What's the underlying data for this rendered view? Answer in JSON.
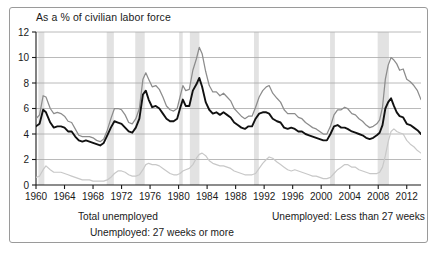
{
  "chart_title": "As a % of civilian labor force",
  "axes": {
    "y_ticks": [
      "0",
      "2",
      "4",
      "6",
      "8",
      "10",
      "12"
    ],
    "x_ticks": [
      "1960",
      "1964",
      "1968",
      "1972",
      "1976",
      "1980",
      "1984",
      "1988",
      "1992",
      "1996",
      "2000",
      "2004",
      "2008",
      "2012"
    ]
  },
  "legend": {
    "total": "Total unemployed",
    "less27": "Unemployed: Less than 27 weeks",
    "more27": "Unemployed: 27 weeks or more"
  },
  "colors": {
    "total": "#8c8c8c",
    "less27": "#111111",
    "more27": "#c8c8c8",
    "recession_band": "#e2e2e2",
    "gridline": "#a8a8a8",
    "axis": "#1a1a1a",
    "frame": "#9a9a9a"
  },
  "chart_data": {
    "type": "line",
    "title": "As a % of civilian labor force",
    "xlabel": "",
    "ylabel": "",
    "xlim": [
      1960,
      2014
    ],
    "ylim": [
      0,
      12
    ],
    "grid": true,
    "legend_position": "bottom",
    "recessions": [
      [
        1960.33,
        1961.17
      ],
      [
        1969.92,
        1970.92
      ],
      [
        1973.92,
        1975.25
      ],
      [
        1980.08,
        1980.58
      ],
      [
        1981.58,
        1982.92
      ],
      [
        1990.58,
        1991.25
      ],
      [
        2001.25,
        2001.92
      ],
      [
        2007.92,
        2009.5
      ]
    ],
    "series": [
      {
        "name": "Total unemployed",
        "color": "#8c8c8c",
        "x": [
          1960.0,
          1960.5,
          1961.0,
          1961.4,
          1962.0,
          1962.5,
          1963.0,
          1963.5,
          1964.0,
          1964.5,
          1965.0,
          1965.5,
          1966.0,
          1966.5,
          1967.0,
          1967.5,
          1968.0,
          1968.5,
          1969.0,
          1969.5,
          1970.0,
          1970.5,
          1971.0,
          1971.5,
          1972.0,
          1972.5,
          1973.0,
          1973.5,
          1974.0,
          1974.5,
          1975.0,
          1975.4,
          1975.8,
          1976.3,
          1976.8,
          1977.3,
          1977.8,
          1978.3,
          1978.8,
          1979.3,
          1979.8,
          1980.2,
          1980.6,
          1981.0,
          1981.5,
          1982.0,
          1982.5,
          1982.9,
          1983.3,
          1983.8,
          1984.3,
          1984.8,
          1985.3,
          1985.8,
          1986.3,
          1986.8,
          1987.3,
          1987.8,
          1988.3,
          1988.8,
          1989.3,
          1989.8,
          1990.3,
          1990.8,
          1991.3,
          1991.8,
          1992.3,
          1992.7,
          1993.2,
          1993.8,
          1994.3,
          1994.8,
          1995.3,
          1995.8,
          1996.3,
          1996.8,
          1997.3,
          1997.8,
          1998.3,
          1998.8,
          1999.3,
          1999.8,
          2000.3,
          2000.8,
          2001.3,
          2001.8,
          2002.3,
          2002.8,
          2003.3,
          2003.7,
          2004.3,
          2004.8,
          2005.3,
          2005.8,
          2006.3,
          2006.8,
          2007.3,
          2007.8,
          2008.2,
          2008.6,
          2009.0,
          2009.4,
          2009.8,
          2010.2,
          2010.6,
          2011.0,
          2011.5,
          2012.0,
          2012.5,
          2013.0,
          2013.5,
          2014.0
        ],
        "y": [
          5.2,
          5.5,
          7.0,
          6.9,
          6.0,
          5.6,
          5.7,
          5.6,
          5.4,
          5.0,
          4.9,
          4.4,
          3.9,
          3.8,
          3.8,
          3.8,
          3.7,
          3.5,
          3.4,
          3.6,
          4.3,
          5.2,
          6.0,
          6.0,
          5.9,
          5.5,
          4.9,
          4.8,
          5.2,
          6.0,
          8.3,
          8.8,
          8.3,
          7.7,
          7.8,
          7.5,
          6.9,
          6.2,
          5.9,
          5.8,
          6.0,
          6.9,
          7.8,
          7.4,
          7.5,
          9.0,
          9.9,
          10.8,
          10.3,
          8.9,
          7.8,
          7.3,
          7.3,
          7.0,
          7.2,
          6.9,
          6.6,
          6.0,
          5.7,
          5.4,
          5.2,
          5.4,
          5.4,
          6.1,
          6.9,
          7.4,
          7.7,
          7.8,
          7.2,
          6.8,
          6.5,
          5.9,
          5.6,
          5.6,
          5.6,
          5.3,
          5.2,
          4.9,
          4.7,
          4.5,
          4.4,
          4.2,
          4.0,
          4.0,
          4.6,
          5.5,
          5.9,
          5.9,
          6.1,
          6.0,
          5.6,
          5.5,
          5.2,
          5.0,
          4.7,
          4.5,
          4.6,
          4.8,
          5.1,
          6.1,
          8.3,
          9.4,
          10.0,
          9.8,
          9.5,
          9.0,
          9.1,
          8.3,
          8.1,
          7.8,
          7.4,
          6.7
        ]
      },
      {
        "name": "Unemployed: Less than 27 weeks",
        "color": "#111111",
        "x": [
          1960.0,
          1960.5,
          1961.0,
          1961.4,
          1962.0,
          1962.5,
          1963.0,
          1963.5,
          1964.0,
          1964.5,
          1965.0,
          1965.5,
          1966.0,
          1966.5,
          1967.0,
          1967.5,
          1968.0,
          1968.5,
          1969.0,
          1969.5,
          1970.0,
          1970.5,
          1971.0,
          1971.5,
          1972.0,
          1972.5,
          1973.0,
          1973.5,
          1974.0,
          1974.5,
          1975.0,
          1975.4,
          1975.8,
          1976.3,
          1976.8,
          1977.3,
          1977.8,
          1978.3,
          1978.8,
          1979.3,
          1979.8,
          1980.2,
          1980.6,
          1981.0,
          1981.5,
          1982.0,
          1982.5,
          1982.9,
          1983.3,
          1983.8,
          1984.3,
          1984.8,
          1985.3,
          1985.8,
          1986.3,
          1986.8,
          1987.3,
          1987.8,
          1988.3,
          1988.8,
          1989.3,
          1989.8,
          1990.3,
          1990.8,
          1991.3,
          1991.8,
          1992.3,
          1992.7,
          1993.2,
          1993.8,
          1994.3,
          1994.8,
          1995.3,
          1995.8,
          1996.3,
          1996.8,
          1997.3,
          1997.8,
          1998.3,
          1998.8,
          1999.3,
          1999.8,
          2000.3,
          2000.8,
          2001.3,
          2001.8,
          2002.3,
          2002.8,
          2003.3,
          2003.7,
          2004.3,
          2004.8,
          2005.3,
          2005.8,
          2006.3,
          2006.8,
          2007.3,
          2007.8,
          2008.2,
          2008.6,
          2009.0,
          2009.4,
          2009.8,
          2010.2,
          2010.6,
          2011.0,
          2011.5,
          2012.0,
          2012.5,
          2013.0,
          2013.5,
          2014.0
        ],
        "y": [
          4.6,
          4.8,
          5.9,
          5.7,
          4.9,
          4.5,
          4.6,
          4.6,
          4.5,
          4.2,
          4.2,
          3.8,
          3.5,
          3.4,
          3.5,
          3.4,
          3.3,
          3.2,
          3.1,
          3.3,
          3.9,
          4.5,
          5.0,
          4.9,
          4.8,
          4.5,
          4.2,
          4.1,
          4.5,
          5.2,
          7.1,
          7.4,
          6.7,
          6.1,
          6.2,
          6.0,
          5.6,
          5.2,
          5.0,
          5.0,
          5.2,
          6.0,
          6.7,
          6.2,
          6.2,
          7.4,
          7.9,
          8.4,
          7.7,
          6.5,
          5.9,
          5.6,
          5.7,
          5.5,
          5.7,
          5.5,
          5.3,
          4.9,
          4.7,
          4.5,
          4.4,
          4.6,
          4.6,
          5.2,
          5.6,
          5.7,
          5.7,
          5.6,
          5.2,
          5.0,
          4.9,
          4.5,
          4.4,
          4.5,
          4.4,
          4.2,
          4.2,
          4.0,
          3.9,
          3.8,
          3.7,
          3.6,
          3.5,
          3.5,
          4.0,
          4.6,
          4.7,
          4.5,
          4.5,
          4.4,
          4.2,
          4.1,
          4.0,
          3.9,
          3.7,
          3.6,
          3.7,
          3.9,
          4.1,
          4.7,
          6.0,
          6.5,
          6.8,
          6.2,
          5.7,
          5.4,
          5.3,
          4.8,
          4.7,
          4.5,
          4.3,
          4.0
        ]
      },
      {
        "name": "Unemployed: 27 weeks or more",
        "color": "#c8c8c8",
        "x": [
          1960.0,
          1960.5,
          1961.0,
          1961.4,
          1962.0,
          1962.5,
          1963.0,
          1963.5,
          1964.0,
          1964.5,
          1965.0,
          1965.5,
          1966.0,
          1966.5,
          1967.0,
          1967.5,
          1968.0,
          1968.5,
          1969.0,
          1969.5,
          1970.0,
          1970.5,
          1971.0,
          1971.5,
          1972.0,
          1972.5,
          1973.0,
          1973.5,
          1974.0,
          1974.5,
          1975.0,
          1975.4,
          1975.8,
          1976.3,
          1976.8,
          1977.3,
          1977.8,
          1978.3,
          1978.8,
          1979.3,
          1979.8,
          1980.2,
          1980.6,
          1981.0,
          1981.5,
          1982.0,
          1982.5,
          1982.9,
          1983.3,
          1983.8,
          1984.3,
          1984.8,
          1985.3,
          1985.8,
          1986.3,
          1986.8,
          1987.3,
          1987.8,
          1988.3,
          1988.8,
          1989.3,
          1989.8,
          1990.3,
          1990.8,
          1991.3,
          1991.8,
          1992.3,
          1992.7,
          1993.2,
          1993.8,
          1994.3,
          1994.8,
          1995.3,
          1995.8,
          1996.3,
          1996.8,
          1997.3,
          1997.8,
          1998.3,
          1998.8,
          1999.3,
          1999.8,
          2000.3,
          2000.8,
          2001.3,
          2001.8,
          2002.3,
          2002.8,
          2003.3,
          2003.7,
          2004.3,
          2004.8,
          2005.3,
          2005.8,
          2006.3,
          2006.8,
          2007.3,
          2007.8,
          2008.2,
          2008.6,
          2009.0,
          2009.4,
          2009.8,
          2010.2,
          2010.6,
          2011.0,
          2011.5,
          2012.0,
          2012.5,
          2013.0,
          2013.5,
          2014.0
        ],
        "y": [
          0.6,
          0.7,
          1.2,
          1.5,
          1.2,
          1.0,
          1.0,
          1.0,
          0.9,
          0.8,
          0.7,
          0.6,
          0.5,
          0.4,
          0.4,
          0.4,
          0.3,
          0.3,
          0.3,
          0.3,
          0.4,
          0.6,
          0.9,
          1.1,
          1.1,
          1.0,
          0.8,
          0.7,
          0.7,
          0.8,
          1.2,
          1.6,
          1.7,
          1.6,
          1.6,
          1.5,
          1.3,
          1.1,
          0.9,
          0.8,
          0.8,
          0.9,
          1.1,
          1.2,
          1.3,
          1.6,
          2.1,
          2.4,
          2.5,
          2.3,
          1.9,
          1.7,
          1.6,
          1.5,
          1.5,
          1.4,
          1.3,
          1.1,
          1.0,
          0.9,
          0.8,
          0.8,
          0.8,
          0.9,
          1.3,
          1.7,
          2.0,
          2.2,
          2.1,
          1.8,
          1.6,
          1.4,
          1.2,
          1.1,
          1.2,
          1.1,
          1.0,
          0.9,
          0.8,
          0.7,
          0.7,
          0.6,
          0.5,
          0.5,
          0.6,
          0.9,
          1.2,
          1.4,
          1.6,
          1.6,
          1.4,
          1.4,
          1.2,
          1.1,
          1.0,
          0.9,
          0.9,
          0.9,
          1.0,
          1.4,
          2.3,
          3.4,
          4.2,
          4.4,
          4.2,
          4.1,
          4.0,
          3.5,
          3.2,
          3.0,
          2.7,
          2.5
        ]
      }
    ]
  }
}
